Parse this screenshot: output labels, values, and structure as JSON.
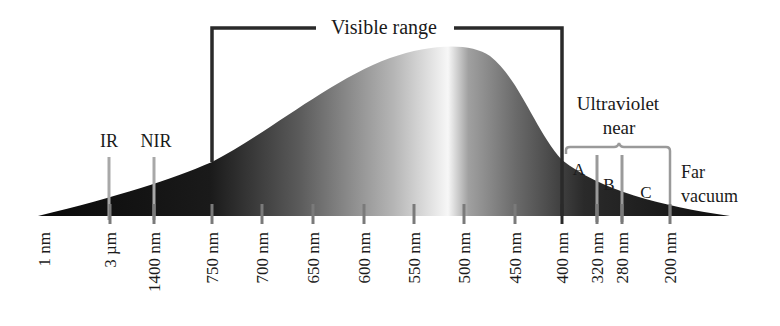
{
  "title": "Visible range",
  "axis_ticks": [
    {
      "label": "1 nm",
      "show_tick": false
    },
    {
      "label": "3 µm",
      "show_tick": true
    },
    {
      "label": "1400 nm",
      "show_tick": true
    },
    {
      "label": "750 nm",
      "show_tick": true
    },
    {
      "label": "700 nm",
      "show_tick": true
    },
    {
      "label": "650 nm",
      "show_tick": true
    },
    {
      "label": "600 nm",
      "show_tick": true
    },
    {
      "label": "550 nm",
      "show_tick": true
    },
    {
      "label": "500 nm",
      "show_tick": true
    },
    {
      "label": "450 nm",
      "show_tick": true
    },
    {
      "label": "400 nm",
      "show_tick": true
    },
    {
      "label": "320 nm",
      "show_tick": true
    },
    {
      "label": "280 nm",
      "show_tick": true
    },
    {
      "label": "200 nm",
      "show_tick": true
    }
  ],
  "regions": {
    "ir": "IR",
    "nir": "NIR",
    "ultraviolet": "Ultraviolet",
    "near": "near",
    "uv_a": "A",
    "uv_b": "B",
    "uv_c": "C",
    "far": "Far",
    "vacuum": "vacuum"
  },
  "colors": {
    "curve_dark": "#111111",
    "curve_light": "#f2f2f2",
    "bracket": "#2a2a2a",
    "uv_bracket": "#9a9a9a",
    "marker": "#a8a8a8"
  }
}
